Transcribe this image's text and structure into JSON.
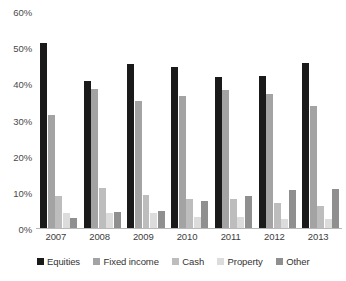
{
  "chart_data": {
    "type": "bar",
    "title": "",
    "subtitle": "",
    "xlabel": "",
    "ylabel": "",
    "categories": [
      "2007",
      "2008",
      "2009",
      "2010",
      "2011",
      "2012",
      "2013"
    ],
    "ylim": [
      0,
      60
    ],
    "ytick_labels": [
      "0%",
      "10%",
      "20%",
      "30%",
      "40%",
      "50%",
      "60%"
    ],
    "ytick_values": [
      0,
      10,
      20,
      30,
      40,
      50,
      60
    ],
    "grid": false,
    "legend_position": "bottom",
    "series": [
      {
        "name": "Equities",
        "color": "#1a1a1a",
        "values": [
          51.3,
          41.0,
          45.7,
          44.8,
          42.0,
          42.2,
          46.0
        ]
      },
      {
        "name": "Fixed income",
        "color": "#a3a3a3",
        "values": [
          31.6,
          38.8,
          35.5,
          36.7,
          38.4,
          37.4,
          34.0
        ]
      },
      {
        "name": "Cash",
        "color": "#bdbdbd",
        "values": [
          9.1,
          11.3,
          9.5,
          8.2,
          8.2,
          7.2,
          6.5
        ]
      },
      {
        "name": "Property",
        "color": "#dcdcdc",
        "values": [
          4.4,
          4.5,
          4.5,
          3.4,
          3.3,
          2.8,
          2.7
        ]
      },
      {
        "name": "Other",
        "color": "#8f8f8f",
        "values": [
          3.0,
          4.8,
          4.9,
          7.7,
          9.0,
          10.9,
          11.0
        ]
      }
    ]
  }
}
